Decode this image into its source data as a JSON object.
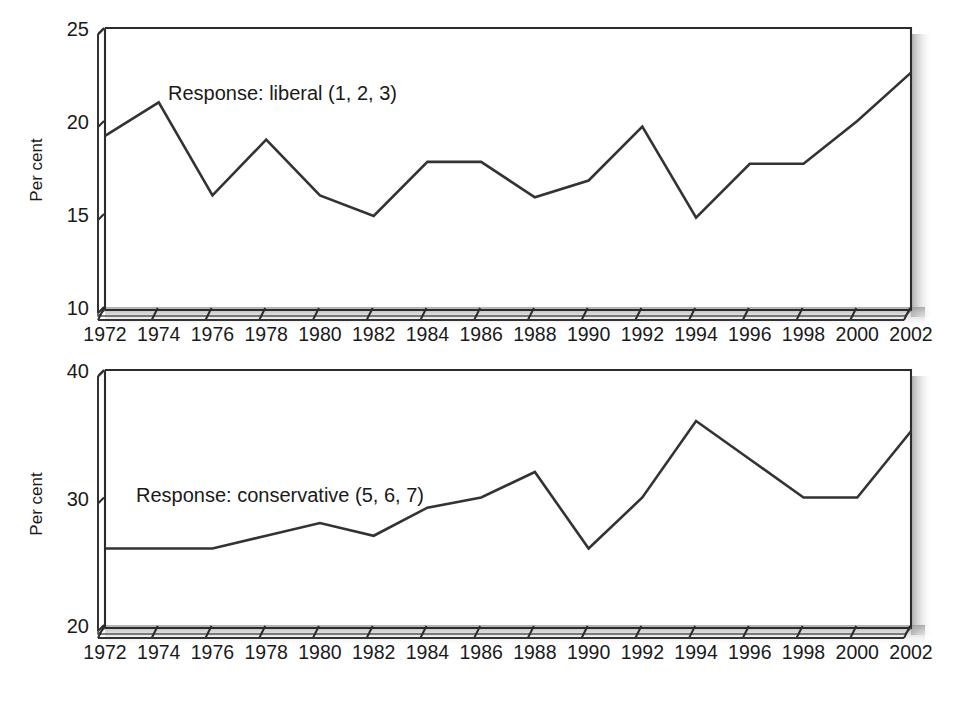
{
  "figure": {
    "background_color": "#ffffff",
    "line_color": "#333333",
    "axis_color": "#2b2b2b",
    "text_color": "#1a1a1a"
  },
  "chart_data": [
    {
      "type": "line",
      "panel": "top",
      "title": "",
      "annotation": "Response: liberal (1, 2, 3)",
      "xlabel": "",
      "ylabel": "Per cent",
      "x": [
        1972,
        1974,
        1976,
        1978,
        1980,
        1982,
        1984,
        1986,
        1988,
        1990,
        1992,
        1994,
        1996,
        1998,
        2000,
        2002
      ],
      "xticklabels": [
        "1972",
        "1974",
        "1976",
        "1978",
        "1980",
        "1982",
        "1984",
        "1986",
        "1988",
        "1990",
        "1992",
        "1994",
        "1996",
        "1998",
        "2000",
        "2002"
      ],
      "values": [
        19.2,
        21.0,
        16.0,
        19.0,
        16.0,
        14.9,
        17.8,
        17.8,
        15.9,
        16.8,
        19.7,
        14.8,
        17.7,
        17.7,
        20.0,
        22.6
      ],
      "yticks": [
        10,
        15,
        20,
        25
      ],
      "yticklabels": [
        "10",
        "15",
        "20",
        "25"
      ],
      "ylim": [
        10,
        25
      ],
      "xlim": [
        1972,
        2002
      ],
      "grid": false,
      "legend": "none",
      "series_name": "liberal"
    },
    {
      "type": "line",
      "panel": "bottom",
      "title": "",
      "annotation": "Response: conservative (5, 6, 7)",
      "xlabel": "",
      "ylabel": "Per cent",
      "x": [
        1972,
        1974,
        1976,
        1978,
        1980,
        1982,
        1984,
        1986,
        1988,
        1990,
        1992,
        1994,
        1996,
        1998,
        2000,
        2002
      ],
      "xticklabels": [
        "1972",
        "1974",
        "1976",
        "1978",
        "1980",
        "1982",
        "1984",
        "1986",
        "1988",
        "1990",
        "1992",
        "1994",
        "1996",
        "1998",
        "2000",
        "2002"
      ],
      "values": [
        26.0,
        26.0,
        26.0,
        27.0,
        28.0,
        27.0,
        29.2,
        30.0,
        32.0,
        26.0,
        30.0,
        36.0,
        33.0,
        30.0,
        30.0,
        35.2
      ],
      "yticks": [
        20,
        30,
        40
      ],
      "yticklabels": [
        "20",
        "30",
        "40"
      ],
      "ylim": [
        20,
        40
      ],
      "xlim": [
        1972,
        2002
      ],
      "grid": false,
      "legend": "none",
      "series_name": "conservative"
    }
  ]
}
